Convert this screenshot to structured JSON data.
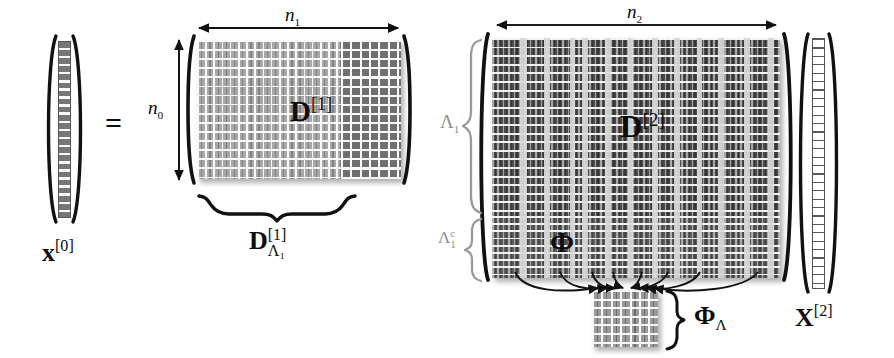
{
  "figure": {
    "type": "diagram",
    "caption_equation": "x^[0] = D^[1] D^[2] X^[2]",
    "background_color": "#ffffff",
    "ink_color": "#0d0d0d",
    "muted_color": "#8e8e8e"
  },
  "labels": {
    "x0": {
      "base": "x",
      "sup": "[0]"
    },
    "equals": "=",
    "n0": {
      "base": "n",
      "sub": "0"
    },
    "n1": {
      "base": "n",
      "sub": "1"
    },
    "n2": {
      "base": "n",
      "sub": "2"
    },
    "D1": {
      "base": "D",
      "sup": "[1]"
    },
    "D1_sub": {
      "base": "D",
      "sup": "[1]",
      "sub": "Λ₁"
    },
    "D2": {
      "base": "D",
      "sup": "[2]"
    },
    "lambda1": {
      "base": "Λ",
      "sub": "1"
    },
    "lambda1c": {
      "base": "Λ",
      "sup": "c",
      "sub": "1"
    },
    "phi": "Φ",
    "phi_lambda": {
      "base": "Φ",
      "sub": "Λ"
    },
    "X2": {
      "base": "X",
      "sup": "[2]"
    }
  },
  "blocks": {
    "x0_vector": {
      "rows": 22,
      "cols": 1,
      "fill": "dense",
      "name": "x^[0]"
    },
    "D1_main": {
      "texture": "fine",
      "name": "D^[1] selected columns (Λ₁)"
    },
    "D1_right": {
      "texture": "coarse",
      "name": "D^[1] remaining columns"
    },
    "D2_top": {
      "texture": "dark",
      "name": "D^[2] rows indexed by Λ₁"
    },
    "D2_phi": {
      "texture": "phi",
      "name": "Φ = D^[2] rows indexed by Λ₁ᶜ"
    },
    "phi_lambda_block": {
      "rows": 7,
      "cols": 7,
      "texture": "small",
      "name": "Φ_Λ"
    },
    "X2_vector": {
      "rows": 34,
      "cols": 1,
      "fill": "sparse",
      "name": "X^[2]"
    }
  },
  "annotations": {
    "arrow_n1": "horizontal double-headed width arrow over D^[1]",
    "arrow_n0": "vertical double-headed height arrow left of D^[1]",
    "arrow_n2": "horizontal double-headed width arrow over D^[2]",
    "brace_D1": "under-brace below the left part of D^[1]",
    "brace_lambda1": "right-opening brace spanning the upper rows of D^[2]",
    "brace_lambda1c": "right-opening brace spanning the lower rows of D^[2]",
    "brace_phi_lambda": "right-opening brace beside the small Φ_Λ block",
    "curved_arrows": "eight curved arrows from the Φ band converging into Φ_Λ"
  },
  "stripe_columns_D2": [
    45,
    80,
    116,
    133,
    168,
    200,
    236,
    266,
    300,
    330,
    372,
    410
  ]
}
